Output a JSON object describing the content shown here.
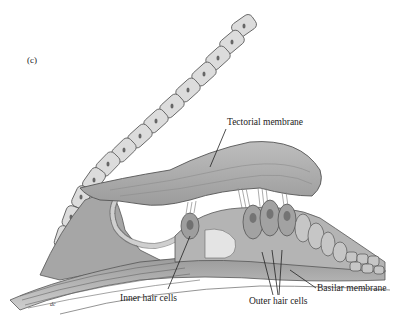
{
  "figure": {
    "panel_label": "(c)",
    "labels": {
      "tectorial_membrane": "Tectorial membrane",
      "inner_hair_cells": "Inner hair cells",
      "outer_hair_cells": "Outer hair cells",
      "basilar_membrane": "Basilar membrane"
    },
    "signature": "dc"
  },
  "colors": {
    "background": "#ffffff",
    "tissue_light": "#c8c8c8",
    "tissue_mid": "#a8a8a8",
    "tissue_dark": "#7a7a7a",
    "outline": "#444444",
    "text": "#222222"
  }
}
